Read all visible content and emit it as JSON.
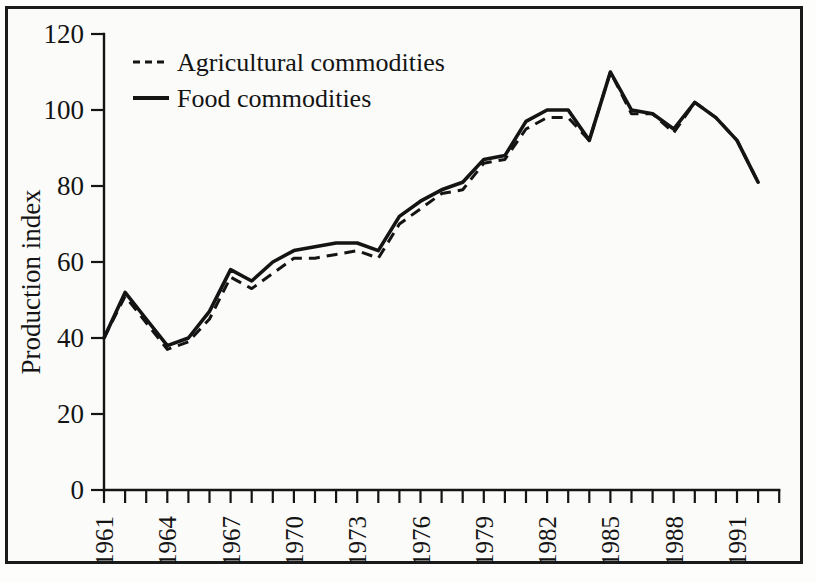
{
  "chart_data": {
    "type": "line",
    "title": "",
    "xlabel": "",
    "ylabel": "Production index",
    "ylim": [
      0,
      120
    ],
    "yticks": [
      0,
      20,
      40,
      60,
      80,
      100,
      120
    ],
    "ytick_labels": [
      "0",
      "20",
      "40",
      "60",
      "80",
      "100",
      "120"
    ],
    "xlim": [
      1961,
      1993
    ],
    "xticks": [
      1961,
      1962,
      1963,
      1964,
      1965,
      1966,
      1967,
      1968,
      1969,
      1970,
      1971,
      1972,
      1973,
      1974,
      1975,
      1976,
      1977,
      1978,
      1979,
      1980,
      1981,
      1982,
      1983,
      1984,
      1985,
      1986,
      1987,
      1988,
      1989,
      1990,
      1991,
      1992,
      1993
    ],
    "xtick_labels": [
      "1961",
      "1964",
      "1967",
      "1970",
      "1973",
      "1976",
      "1979",
      "1982",
      "1985",
      "1988",
      "1991"
    ],
    "labeled_xticks": [
      1961,
      1964,
      1967,
      1970,
      1973,
      1976,
      1979,
      1982,
      1985,
      1988,
      1991
    ],
    "x": [
      1961,
      1962,
      1963,
      1964,
      1965,
      1966,
      1967,
      1968,
      1969,
      1970,
      1971,
      1972,
      1973,
      1974,
      1975,
      1976,
      1977,
      1978,
      1979,
      1980,
      1981,
      1982,
      1983,
      1984,
      1985,
      1986,
      1987,
      1988,
      1989,
      1990,
      1991,
      1992
    ],
    "grid": false,
    "legend_position": "top-left",
    "series": [
      {
        "name": "Agricultural commodities",
        "style": "dashed",
        "color": "#141414",
        "values": [
          40,
          51,
          44,
          37,
          39,
          45,
          56,
          53,
          57,
          61,
          61,
          62,
          63,
          61,
          70,
          74,
          78,
          79,
          86,
          87,
          95,
          98,
          98,
          92,
          110,
          99,
          99,
          94,
          102,
          98,
          92,
          81
        ]
      },
      {
        "name": "Food commodities",
        "style": "solid",
        "color": "#141414",
        "values": [
          40,
          52,
          45,
          38,
          40,
          47,
          58,
          55,
          60,
          63,
          64,
          65,
          65,
          63,
          72,
          76,
          79,
          81,
          87,
          88,
          97,
          100,
          100,
          92,
          110,
          100,
          99,
          95,
          102,
          98,
          92,
          81
        ]
      }
    ]
  },
  "legend": {
    "items": [
      {
        "label": "Agricultural commodities",
        "style": "dashed"
      },
      {
        "label": "Food commodities",
        "style": "solid"
      }
    ]
  },
  "axes": {
    "y_title": "Production index"
  }
}
